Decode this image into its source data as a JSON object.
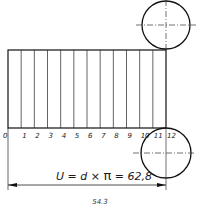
{
  "drawing": {
    "rectangle": {
      "x": 8,
      "y": 50,
      "width": 158,
      "height": 78
    },
    "divisions": [
      "0",
      "1",
      "2",
      "3",
      "4",
      "5",
      "6",
      "7",
      "8",
      "9",
      "10",
      "11",
      "12"
    ],
    "top_circle": {
      "cx": 166,
      "cy": 25,
      "r": 24
    },
    "bottom_circle": {
      "cx": 166,
      "cy": 153,
      "r": 25
    },
    "dimension_label": "U = d × π = 62,8",
    "dimension_formula": {
      "left": "U = d ×",
      "pi": "π",
      "right": "= 62,8"
    }
  },
  "caption": "54.3"
}
